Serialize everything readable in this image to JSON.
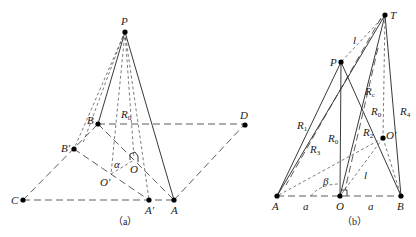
{
  "figure_a": {
    "caption": "（a）",
    "points": {
      "P": "P",
      "B": "B",
      "B_prime": "B′",
      "C": "C",
      "A_prime": "A′",
      "A": "A",
      "D": "D",
      "O": "O",
      "O_prime": "O′"
    },
    "labels": {
      "R0": "R",
      "R0_sub": "0",
      "alpha": "α"
    }
  },
  "figure_b": {
    "caption": "（b）",
    "points": {
      "T": "T",
      "P": "P",
      "A": "A",
      "O": "O",
      "B": "B",
      "O_prime": "O′"
    },
    "labels": {
      "l_top": "l",
      "l_bottom": "l",
      "beta": "β",
      "a_left": "a",
      "a_right": "a",
      "R": "R",
      "R1_sub": "1",
      "R3_sub": "3",
      "R0_sub": "0",
      "Rc_sub": "c",
      "R2_sub": "2",
      "R4_sub": "4"
    }
  }
}
